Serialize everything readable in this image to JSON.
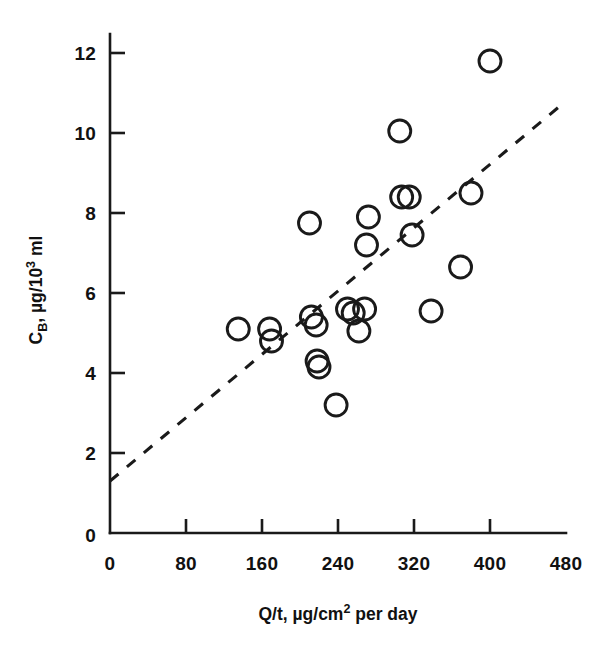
{
  "chart_data": {
    "type": "scatter",
    "title": "",
    "subtitle": "",
    "xlabel": "Q/t, µg/cm2 per day",
    "xlabel_parts": {
      "pre": "Q/t, µg/cm",
      "sup": "2",
      "post": " per day"
    },
    "ylabel": "CB, µg/103 ml",
    "ylabel_parts": {
      "pre": "C",
      "sub": "B",
      "mid": ", µg/10",
      "sup": "3",
      "post": " ml"
    },
    "xlim": [
      0,
      480
    ],
    "ylim": [
      0,
      12.6
    ],
    "xticks": [
      0,
      80,
      160,
      240,
      320,
      400,
      480
    ],
    "xtick_labels": [
      "0",
      "80",
      "160",
      "240",
      "320",
      "400",
      "480"
    ],
    "yticks": [
      0,
      2,
      4,
      6,
      8,
      10,
      12
    ],
    "ytick_labels": [
      "0",
      "2",
      "4",
      "6",
      "8",
      "10",
      "12"
    ],
    "grid": false,
    "legend": null,
    "marker": "open-circle",
    "marker_size_px": 11,
    "series": [
      {
        "name": "samples",
        "points": [
          [
            135,
            5.1
          ],
          [
            168,
            5.1
          ],
          [
            170,
            4.8
          ],
          [
            210,
            7.75
          ],
          [
            212,
            5.4
          ],
          [
            217,
            5.2
          ],
          [
            218,
            4.3
          ],
          [
            220,
            4.15
          ],
          [
            238,
            3.2
          ],
          [
            250,
            5.6
          ],
          [
            256,
            5.5
          ],
          [
            262,
            5.05
          ],
          [
            268,
            5.6
          ],
          [
            270,
            7.2
          ],
          [
            272,
            7.9
          ],
          [
            305,
            10.05
          ],
          [
            307,
            8.4
          ],
          [
            315,
            8.4
          ],
          [
            318,
            7.45
          ],
          [
            338,
            5.55
          ],
          [
            369,
            6.65
          ],
          [
            380,
            8.5
          ],
          [
            400,
            11.8
          ]
        ]
      }
    ],
    "trendline": {
      "style": "dashed",
      "x_start": 0,
      "y_start": 1.3,
      "x_end": 475,
      "y_end": 10.7
    },
    "colors": {
      "ink": "#1a1a1a",
      "background": "#ffffff"
    }
  }
}
